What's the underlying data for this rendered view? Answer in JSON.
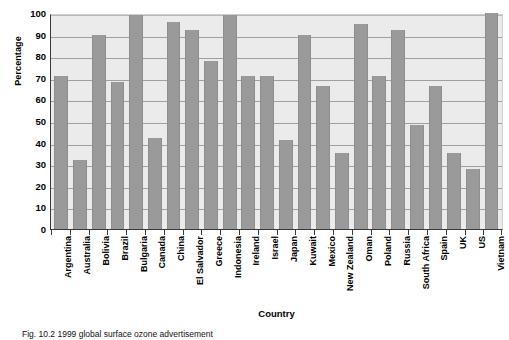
{
  "chart_data": {
    "type": "bar",
    "title": "",
    "xlabel": "Country",
    "ylabel": "Percentage",
    "ylim": [
      0,
      100
    ],
    "ytick_step": 10,
    "yticks": [
      100,
      90,
      80,
      70,
      60,
      50,
      40,
      30,
      20,
      10,
      0
    ],
    "grid": true,
    "legend": "none",
    "bar_color": "#9a9a9a",
    "plot_background": "#ebebeb",
    "categories": [
      "Argentina",
      "Australia",
      "Bolivia",
      "Brazil",
      "Bulgaria",
      "Canada",
      "China",
      "El Salvador",
      "Greece",
      "Indonesia",
      "Ireland",
      "Israel",
      "Japan",
      "Kuwait",
      "Mexico",
      "New Zealand",
      "Oman",
      "Poland",
      "Russia",
      "South Africa",
      "Spain",
      "UK",
      "US",
      "Vietnam"
    ],
    "values": [
      71,
      32,
      90,
      68,
      99,
      42,
      96,
      92,
      78,
      99,
      71,
      71,
      41,
      90,
      66,
      35,
      95,
      71,
      92,
      48,
      66,
      35,
      28,
      100
    ]
  },
  "caption": {
    "text": "Fig. 10.2  1999 global surface ozone advertisement"
  }
}
